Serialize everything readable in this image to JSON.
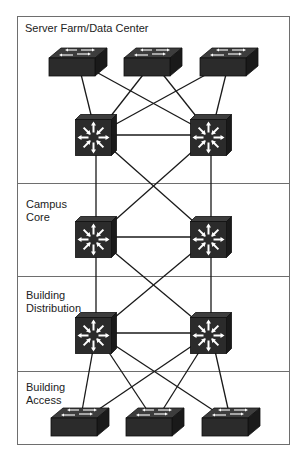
{
  "diagram": {
    "layers": [
      {
        "id": "server-farm",
        "label": "Server Farm/Data Center",
        "top": 16,
        "bottom": 183
      },
      {
        "id": "campus-core",
        "label": "Campus\nCore",
        "top": 183,
        "bottom": 276
      },
      {
        "id": "building-distribution",
        "label": "Building\nDistribution",
        "top": 276,
        "bottom": 371
      },
      {
        "id": "building-access",
        "label": "Building\nAccess",
        "top": 371,
        "bottom": 445
      }
    ],
    "colors": {
      "device": "#2b2b2b",
      "device_top": "#3d3d3d",
      "device_side": "#1a1a1a",
      "link": "#1a1a1a",
      "frame": "#6e6e6e",
      "icon": "#ffffff"
    },
    "devices": [
      {
        "id": "sf-sw1",
        "type": "switch",
        "icon": "layer2-switch-icon",
        "cx": 78,
        "cy": 62
      },
      {
        "id": "sf-sw2",
        "type": "switch",
        "icon": "layer2-switch-icon",
        "cx": 153,
        "cy": 62
      },
      {
        "id": "sf-sw3",
        "type": "switch",
        "icon": "layer2-switch-icon",
        "cx": 229,
        "cy": 62
      },
      {
        "id": "sf-ml1",
        "type": "multilayer",
        "icon": "multilayer-switch-icon",
        "cx": 96,
        "cy": 135
      },
      {
        "id": "sf-ml2",
        "type": "multilayer",
        "icon": "multilayer-switch-icon",
        "cx": 211,
        "cy": 135
      },
      {
        "id": "core-ml1",
        "type": "multilayer",
        "icon": "multilayer-switch-icon",
        "cx": 96,
        "cy": 237
      },
      {
        "id": "core-ml2",
        "type": "multilayer",
        "icon": "multilayer-switch-icon",
        "cx": 211,
        "cy": 237
      },
      {
        "id": "dist-ml1",
        "type": "multilayer",
        "icon": "multilayer-switch-icon",
        "cx": 96,
        "cy": 333
      },
      {
        "id": "dist-ml2",
        "type": "multilayer",
        "icon": "multilayer-switch-icon",
        "cx": 211,
        "cy": 333
      },
      {
        "id": "acc-sw1",
        "type": "switch",
        "icon": "layer2-switch-icon",
        "cx": 80,
        "cy": 422
      },
      {
        "id": "acc-sw2",
        "type": "switch",
        "icon": "layer2-switch-icon",
        "cx": 155,
        "cy": 422
      },
      {
        "id": "acc-sw3",
        "type": "switch",
        "icon": "layer2-switch-icon",
        "cx": 231,
        "cy": 422
      }
    ],
    "links": [
      [
        "sf-sw1",
        "sf-ml1"
      ],
      [
        "sf-sw1",
        "sf-ml2"
      ],
      [
        "sf-sw2",
        "sf-ml1"
      ],
      [
        "sf-sw2",
        "sf-ml2"
      ],
      [
        "sf-sw3",
        "sf-ml1"
      ],
      [
        "sf-sw3",
        "sf-ml2"
      ],
      [
        "sf-ml1",
        "sf-ml2"
      ],
      [
        "sf-ml1",
        "core-ml1"
      ],
      [
        "sf-ml1",
        "core-ml2"
      ],
      [
        "sf-ml2",
        "core-ml1"
      ],
      [
        "sf-ml2",
        "core-ml2"
      ],
      [
        "core-ml1",
        "core-ml2"
      ],
      [
        "core-ml1",
        "dist-ml1"
      ],
      [
        "core-ml1",
        "dist-ml2"
      ],
      [
        "core-ml2",
        "dist-ml1"
      ],
      [
        "core-ml2",
        "dist-ml2"
      ],
      [
        "dist-ml1",
        "dist-ml2"
      ],
      [
        "dist-ml1",
        "acc-sw1"
      ],
      [
        "dist-ml1",
        "acc-sw2"
      ],
      [
        "dist-ml1",
        "acc-sw3"
      ],
      [
        "dist-ml2",
        "acc-sw1"
      ],
      [
        "dist-ml2",
        "acc-sw2"
      ],
      [
        "dist-ml2",
        "acc-sw3"
      ]
    ]
  }
}
